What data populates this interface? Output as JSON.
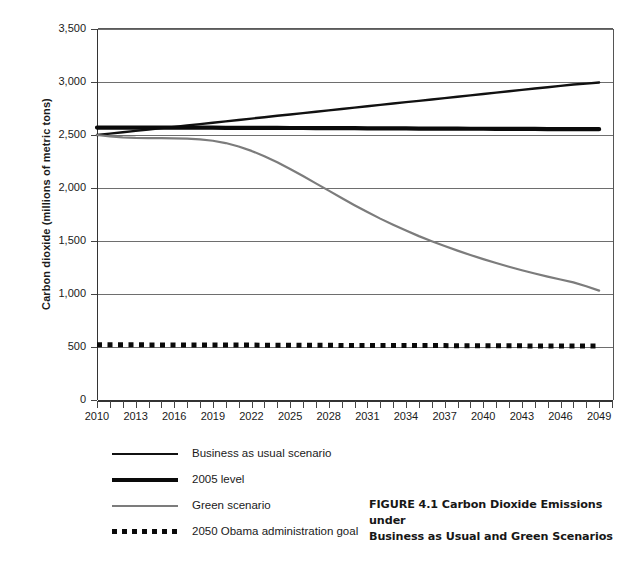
{
  "figure": {
    "caption_line1": "FIGURE 4.1 Carbon Dioxide Emissions under",
    "caption_line2": "Business as Usual and Green Scenarios"
  },
  "axes": {
    "y_title": "Carbon dioxide (millions of metric tons)",
    "x_title": ""
  },
  "legend": {
    "items": [
      {
        "label": "Business as usual scenario",
        "style": "solid",
        "color": "#111111"
      },
      {
        "label": "2005 level",
        "style": "solid-thick",
        "color": "#0a0a0a"
      },
      {
        "label": "Green scenario",
        "style": "solid",
        "color": "#7c7c7c"
      },
      {
        "label": "2050 Obama administration goal",
        "style": "dotted",
        "color": "#0a0a0a"
      }
    ]
  },
  "chart_data": {
    "type": "line",
    "title": "FIGURE 4.1 Carbon Dioxide Emissions under Business as Usual and Green Scenarios",
    "xlabel": "",
    "ylabel": "Carbon dioxide (millions of metric tons)",
    "xlim": [
      2010,
      2050
    ],
    "ylim": [
      0,
      3500
    ],
    "yticks": [
      0,
      500,
      1000,
      1500,
      2000,
      2500,
      3000,
      3500
    ],
    "ytick_labels": [
      "0",
      "500",
      "1,000",
      "1,500",
      "2,000",
      "2,500",
      "3,000",
      "3,500"
    ],
    "xticks": [
      2010,
      2011,
      2012,
      2013,
      2014,
      2015,
      2016,
      2017,
      2018,
      2019,
      2020,
      2021,
      2022,
      2023,
      2024,
      2025,
      2026,
      2027,
      2028,
      2029,
      2030,
      2031,
      2032,
      2033,
      2034,
      2035,
      2036,
      2037,
      2038,
      2039,
      2040,
      2041,
      2042,
      2043,
      2044,
      2045,
      2046,
      2047,
      2048,
      2049,
      2050
    ],
    "xtick_labels": [
      "2010",
      "2013",
      "2016",
      "2019",
      "2022",
      "2025",
      "2028",
      "2031",
      "2034",
      "2037",
      "2040",
      "2043",
      "2046",
      "2049"
    ],
    "xtick_label_years": [
      2010,
      2013,
      2016,
      2019,
      2022,
      2025,
      2028,
      2031,
      2034,
      2037,
      2040,
      2043,
      2046,
      2049
    ],
    "grid": "horizontal",
    "legend_position": "below",
    "x": [
      2010,
      2011,
      2012,
      2013,
      2014,
      2015,
      2016,
      2017,
      2018,
      2019,
      2020,
      2021,
      2022,
      2023,
      2024,
      2025,
      2026,
      2027,
      2028,
      2029,
      2030,
      2031,
      2032,
      2033,
      2034,
      2035,
      2036,
      2037,
      2038,
      2039,
      2040,
      2041,
      2042,
      2043,
      2044,
      2045,
      2046,
      2047,
      2048,
      2049
    ],
    "series": [
      {
        "name": "Business as usual scenario",
        "color": "#111111",
        "style": "solid",
        "width": 2.4,
        "values": [
          2500,
          2513,
          2526,
          2539,
          2552,
          2565,
          2577,
          2590,
          2603,
          2616,
          2629,
          2642,
          2655,
          2668,
          2681,
          2693,
          2706,
          2719,
          2732,
          2745,
          2758,
          2771,
          2784,
          2797,
          2810,
          2822,
          2835,
          2848,
          2861,
          2874,
          2887,
          2900,
          2913,
          2926,
          2939,
          2951,
          2964,
          2977,
          2985,
          2995
        ]
      },
      {
        "name": "2005 level",
        "color": "#0a0a0a",
        "style": "solid-thick",
        "width": 4.2,
        "values": [
          2570,
          2570,
          2570,
          2570,
          2570,
          2570,
          2570,
          2570,
          2570,
          2570,
          2568,
          2568,
          2568,
          2567,
          2567,
          2566,
          2566,
          2565,
          2565,
          2564,
          2564,
          2563,
          2563,
          2562,
          2562,
          2561,
          2561,
          2560,
          2560,
          2559,
          2559,
          2558,
          2558,
          2557,
          2557,
          2556,
          2556,
          2555,
          2555,
          2555
        ]
      },
      {
        "name": "Green scenario",
        "color": "#7c7c7c",
        "style": "solid",
        "width": 2.2,
        "values": [
          2500,
          2487,
          2478,
          2473,
          2471,
          2470,
          2469,
          2466,
          2459,
          2446,
          2424,
          2392,
          2350,
          2300,
          2243,
          2180,
          2113,
          2044,
          1975,
          1906,
          1838,
          1773,
          1711,
          1653,
          1598,
          1546,
          1498,
          1452,
          1409,
          1368,
          1329,
          1292,
          1257,
          1224,
          1193,
          1164,
          1137,
          1110,
          1073,
          1032
        ]
      },
      {
        "name": "2050 Obama administration goal",
        "color": "#0a0a0a",
        "style": "dotted",
        "width": 5,
        "values": [
          522,
          521,
          521,
          521,
          520,
          520,
          520,
          519,
          519,
          519,
          518,
          518,
          518,
          517,
          517,
          517,
          516,
          516,
          516,
          515,
          515,
          515,
          514,
          514,
          514,
          513,
          513,
          513,
          512,
          512,
          512,
          511,
          511,
          511,
          510,
          510,
          510,
          509,
          509,
          509
        ]
      }
    ]
  }
}
